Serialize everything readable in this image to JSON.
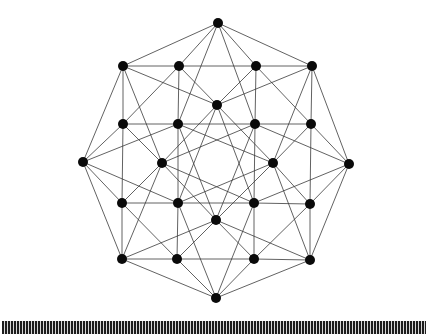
{
  "figure": {
    "node_radius": 5,
    "node_color": "#0a0a0a",
    "edge_color": "#3a3a3a",
    "background": "#ffffff"
  },
  "nodes": [
    {
      "id": "O0",
      "x": 218,
      "y": 23
    },
    {
      "id": "O1",
      "x": 312,
      "y": 66
    },
    {
      "id": "O2",
      "x": 349,
      "y": 164
    },
    {
      "id": "O3",
      "x": 310,
      "y": 260
    },
    {
      "id": "O4",
      "x": 216,
      "y": 298
    },
    {
      "id": "O5",
      "x": 122,
      "y": 259
    },
    {
      "id": "O6",
      "x": 83,
      "y": 162
    },
    {
      "id": "O7",
      "x": 123,
      "y": 66
    },
    {
      "id": "P0",
      "x": 256,
      "y": 66
    },
    {
      "id": "P1",
      "x": 311,
      "y": 124
    },
    {
      "id": "P2",
      "x": 310,
      "y": 204
    },
    {
      "id": "P3",
      "x": 254,
      "y": 259
    },
    {
      "id": "P4",
      "x": 177,
      "y": 259
    },
    {
      "id": "P5",
      "x": 122,
      "y": 203
    },
    {
      "id": "P6",
      "x": 123,
      "y": 124
    },
    {
      "id": "P7",
      "x": 179,
      "y": 66
    },
    {
      "id": "Q0",
      "x": 217,
      "y": 105
    },
    {
      "id": "Q1",
      "x": 255,
      "y": 124
    },
    {
      "id": "Q2",
      "x": 273,
      "y": 163
    },
    {
      "id": "Q3",
      "x": 254,
      "y": 203
    },
    {
      "id": "Q4",
      "x": 216,
      "y": 220
    },
    {
      "id": "Q5",
      "x": 178,
      "y": 203
    },
    {
      "id": "Q6",
      "x": 162,
      "y": 163
    },
    {
      "id": "Q7",
      "x": 178,
      "y": 124
    }
  ],
  "edges": [
    [
      "O0",
      "O1"
    ],
    [
      "O1",
      "O2"
    ],
    [
      "O2",
      "O3"
    ],
    [
      "O3",
      "O4"
    ],
    [
      "O4",
      "O5"
    ],
    [
      "O5",
      "O6"
    ],
    [
      "O6",
      "O7"
    ],
    [
      "O7",
      "O0"
    ],
    [
      "O0",
      "P0"
    ],
    [
      "O1",
      "P1"
    ],
    [
      "O2",
      "P2"
    ],
    [
      "O3",
      "P3"
    ],
    [
      "O4",
      "P4"
    ],
    [
      "O5",
      "P5"
    ],
    [
      "O6",
      "P6"
    ],
    [
      "O7",
      "P7"
    ],
    [
      "O0",
      "P7"
    ],
    [
      "O1",
      "P0"
    ],
    [
      "O2",
      "P1"
    ],
    [
      "O3",
      "P2"
    ],
    [
      "O4",
      "P3"
    ],
    [
      "O5",
      "P4"
    ],
    [
      "O6",
      "P5"
    ],
    [
      "O7",
      "P6"
    ],
    [
      "O0",
      "Q1"
    ],
    [
      "O1",
      "Q2"
    ],
    [
      "O2",
      "Q3"
    ],
    [
      "O3",
      "Q4"
    ],
    [
      "O4",
      "Q5"
    ],
    [
      "O5",
      "Q6"
    ],
    [
      "O6",
      "Q7"
    ],
    [
      "O7",
      "Q0"
    ],
    [
      "O0",
      "Q7"
    ],
    [
      "O1",
      "Q0"
    ],
    [
      "O2",
      "Q1"
    ],
    [
      "O3",
      "Q2"
    ],
    [
      "O4",
      "Q3"
    ],
    [
      "O5",
      "Q4"
    ],
    [
      "O6",
      "Q5"
    ],
    [
      "O7",
      "Q6"
    ],
    [
      "P0",
      "P1"
    ],
    [
      "P1",
      "P2"
    ],
    [
      "P2",
      "P3"
    ],
    [
      "P3",
      "P4"
    ],
    [
      "P4",
      "P5"
    ],
    [
      "P5",
      "P6"
    ],
    [
      "P6",
      "P7"
    ],
    [
      "P7",
      "P0"
    ],
    [
      "P0",
      "Q0"
    ],
    [
      "P1",
      "Q1"
    ],
    [
      "P2",
      "Q2"
    ],
    [
      "P3",
      "Q3"
    ],
    [
      "P4",
      "Q4"
    ],
    [
      "P5",
      "Q5"
    ],
    [
      "P6",
      "Q6"
    ],
    [
      "P7",
      "Q7"
    ],
    [
      "P0",
      "Q1"
    ],
    [
      "P1",
      "Q2"
    ],
    [
      "P2",
      "Q3"
    ],
    [
      "P3",
      "Q4"
    ],
    [
      "P4",
      "Q5"
    ],
    [
      "P5",
      "Q6"
    ],
    [
      "P6",
      "Q7"
    ],
    [
      "P7",
      "Q0"
    ],
    [
      "Q0",
      "Q2"
    ],
    [
      "Q1",
      "Q3"
    ],
    [
      "Q2",
      "Q4"
    ],
    [
      "Q3",
      "Q5"
    ],
    [
      "Q4",
      "Q6"
    ],
    [
      "Q5",
      "Q7"
    ],
    [
      "Q6",
      "Q0"
    ],
    [
      "Q7",
      "Q1"
    ],
    [
      "Q0",
      "Q3"
    ],
    [
      "Q1",
      "Q4"
    ],
    [
      "Q2",
      "Q5"
    ],
    [
      "Q3",
      "Q6"
    ],
    [
      "Q4",
      "Q7"
    ],
    [
      "Q5",
      "Q0"
    ],
    [
      "Q6",
      "Q1"
    ],
    [
      "Q7",
      "Q2"
    ]
  ],
  "stripe_band": {
    "dark_color": "#1e1e1e",
    "light_color": "#d8d8d8"
  }
}
